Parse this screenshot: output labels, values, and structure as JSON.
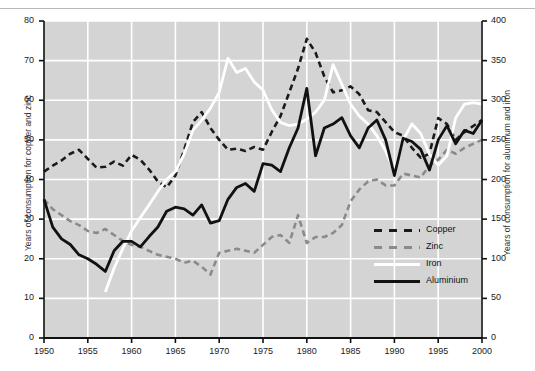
{
  "chart_data": {
    "type": "line",
    "title": "",
    "xlabel": "",
    "ylabel": "Years of consumption for copper and zinc",
    "ylabel_right": "Years of consumption for aluminum and iron",
    "xlim": [
      1950,
      2000
    ],
    "ylim": [
      0,
      80
    ],
    "ylim_right": [
      0,
      400
    ],
    "grid": true,
    "legend_position": "inside-lower-right",
    "xticks": [
      1950,
      1955,
      1960,
      1965,
      1970,
      1975,
      1980,
      1985,
      1990,
      1995,
      2000
    ],
    "yticks_left": [
      0,
      10,
      20,
      30,
      40,
      50,
      60,
      70,
      80
    ],
    "yticks_right": [
      0,
      50,
      100,
      150,
      200,
      250,
      300,
      350,
      400
    ],
    "plot_bgcolor": "#d4d4d4",
    "grid_color": "#ffffff",
    "series": [
      {
        "name": "Copper",
        "axis": "left",
        "color": "#1a1a1a",
        "style": "dashed",
        "x": [
          1950,
          1951,
          1952,
          1953,
          1954,
          1955,
          1956,
          1957,
          1958,
          1959,
          1960,
          1961,
          1962,
          1963,
          1964,
          1965,
          1966,
          1967,
          1968,
          1969,
          1970,
          1971,
          1972,
          1973,
          1974,
          1975,
          1976,
          1977,
          1978,
          1979,
          1980,
          1981,
          1982,
          1983,
          1984,
          1985,
          1986,
          1987,
          1988,
          1989,
          1990,
          1991,
          1992,
          1993,
          1994,
          1995,
          1996,
          1997,
          1998,
          1999,
          2000
        ],
        "values": [
          42.0,
          43.5,
          44.8,
          46.5,
          47.5,
          45.2,
          43.0,
          43.2,
          44.5,
          43.5,
          46.2,
          45.0,
          42.5,
          39.5,
          38.0,
          41.0,
          47.5,
          54.5,
          57.0,
          53.0,
          50.0,
          47.5,
          47.8,
          47.2,
          48.2,
          47.5,
          52.0,
          56.0,
          62.0,
          68.0,
          75.5,
          72.0,
          66.0,
          62.0,
          62.5,
          63.5,
          61.5,
          57.5,
          57.0,
          54.5,
          52.0,
          51.0,
          48.0,
          45.5,
          46.5,
          55.5,
          54.0,
          50.0,
          52.0,
          53.5,
          55.0
        ]
      },
      {
        "name": "Zinc",
        "axis": "left",
        "color": "#8a8a8a",
        "style": "dashed",
        "x": [
          1950,
          1951,
          1952,
          1953,
          1954,
          1955,
          1956,
          1957,
          1958,
          1959,
          1960,
          1961,
          1962,
          1963,
          1964,
          1965,
          1966,
          1967,
          1968,
          1969,
          1970,
          1971,
          1972,
          1973,
          1974,
          1975,
          1976,
          1977,
          1978,
          1979,
          1980,
          1981,
          1982,
          1983,
          1984,
          1985,
          1986,
          1987,
          1988,
          1989,
          1990,
          1991,
          1992,
          1993,
          1994,
          1995,
          1996,
          1997,
          1998,
          1999,
          2000
        ],
        "values": [
          35.0,
          32.5,
          31.0,
          29.5,
          28.5,
          27.0,
          26.5,
          27.5,
          26.0,
          24.5,
          23.5,
          23.0,
          22.0,
          21.0,
          20.5,
          20.0,
          19.0,
          19.5,
          18.0,
          16.0,
          21.5,
          22.0,
          22.5,
          22.0,
          21.5,
          23.5,
          25.5,
          26.0,
          24.0,
          31.0,
          24.0,
          25.5,
          25.5,
          26.5,
          28.5,
          34.5,
          37.5,
          39.5,
          40.0,
          38.5,
          38.5,
          41.5,
          41.0,
          40.5,
          43.5,
          45.0,
          47.5,
          46.5,
          48.0,
          49.0,
          50.0
        ]
      },
      {
        "name": "Iron",
        "axis": "right",
        "color": "#ffffff",
        "style": "solid",
        "x": [
          1957,
          1958,
          1959,
          1960,
          1961,
          1962,
          1963,
          1964,
          1965,
          1966,
          1967,
          1968,
          1969,
          1970,
          1971,
          1972,
          1973,
          1974,
          1975,
          1976,
          1977,
          1978,
          1979,
          1980,
          1981,
          1982,
          1983,
          1984,
          1985,
          1986,
          1987,
          1988,
          1989,
          1990,
          1991,
          1992,
          1993,
          1994,
          1995,
          1996,
          1997,
          1998,
          1999,
          2000
        ],
        "values": [
          58,
          88,
          113,
          135,
          152,
          168,
          185,
          200,
          210,
          232,
          262,
          275,
          290,
          310,
          353,
          335,
          340,
          323,
          313,
          288,
          272,
          268,
          270,
          276,
          285,
          300,
          345,
          320,
          295,
          280,
          270,
          255,
          236,
          210,
          250,
          270,
          258,
          232,
          218,
          230,
          278,
          295,
          297,
          295
        ]
      },
      {
        "name": "Aluminium",
        "axis": "right",
        "color": "#111111",
        "style": "solid",
        "x": [
          1950,
          1951,
          1952,
          1953,
          1954,
          1955,
          1956,
          1957,
          1958,
          1959,
          1960,
          1961,
          1962,
          1963,
          1964,
          1965,
          1966,
          1967,
          1968,
          1969,
          1970,
          1971,
          1972,
          1973,
          1974,
          1975,
          1976,
          1977,
          1978,
          1979,
          1980,
          1981,
          1982,
          1983,
          1984,
          1985,
          1986,
          1987,
          1988,
          1989,
          1990,
          1991,
          1992,
          1993,
          1994,
          1995,
          1996,
          1997,
          1998,
          1999,
          2000
        ],
        "values": [
          175,
          140,
          125,
          118,
          105,
          100,
          93,
          84,
          110,
          122,
          122,
          115,
          128,
          140,
          160,
          165,
          163,
          155,
          168,
          145,
          148,
          175,
          190,
          195,
          185,
          220,
          218,
          210,
          240,
          265,
          315,
          230,
          265,
          270,
          278,
          255,
          240,
          265,
          275,
          250,
          205,
          252,
          248,
          238,
          212,
          250,
          268,
          245,
          262,
          258,
          275
        ]
      }
    ]
  },
  "axes": {
    "left_title": "Years of consumption for copper and zinc",
    "right_title": "Years of consumption for aluminum and iron",
    "left_ticks": [
      "80",
      "70",
      "60",
      "50",
      "40",
      "30",
      "20",
      "10",
      "0"
    ],
    "right_ticks": [
      "400",
      "350",
      "300",
      "250",
      "200",
      "150",
      "100",
      "50",
      "0"
    ],
    "x_ticks": [
      "1950",
      "1955",
      "1960",
      "1965",
      "1970",
      "1975",
      "1980",
      "1985",
      "1990",
      "1995",
      "2000"
    ]
  },
  "legend": {
    "items": [
      {
        "label": "Copper",
        "swatch": "copper-dashed-swatch"
      },
      {
        "label": "Zinc",
        "swatch": "zinc-dashed-swatch"
      },
      {
        "label": "Iron",
        "swatch": "iron-solid-swatch"
      },
      {
        "label": "Aluminium",
        "swatch": "aluminium-solid-swatch"
      }
    ]
  }
}
